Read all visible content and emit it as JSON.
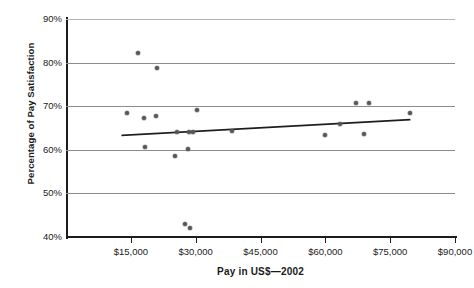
{
  "chart_data": {
    "type": "scatter",
    "title": "",
    "xlabel": "Pay in US$—2002",
    "ylabel": "Percentage of Pay Satisfaction",
    "xlim": [
      0,
      90000
    ],
    "ylim": [
      40,
      90
    ],
    "grid": true,
    "legend_position": "none",
    "xticks": [
      15000,
      30000,
      45000,
      60000,
      75000,
      90000
    ],
    "xtick_labels": [
      "$15,000",
      "$30,000",
      "$45,000",
      "$60,000",
      "$75,000",
      "$90,000"
    ],
    "yticks": [
      40,
      50,
      60,
      70,
      80,
      90
    ],
    "ytick_labels": [
      "40%",
      "50%",
      "60%",
      "70%",
      "80%",
      "90%"
    ],
    "marker_color": "#55555c",
    "trendline_color": "#1d1d1d",
    "points": [
      {
        "x": 14000,
        "y": 68.5
      },
      {
        "x": 16700,
        "y": 82.3
      },
      {
        "x": 18000,
        "y": 67.2
      },
      {
        "x": 18200,
        "y": 60.6
      },
      {
        "x": 20800,
        "y": 67.8
      },
      {
        "x": 21000,
        "y": 78.8
      },
      {
        "x": 25200,
        "y": 58.5
      },
      {
        "x": 25600,
        "y": 64.0
      },
      {
        "x": 27600,
        "y": 42.9
      },
      {
        "x": 28200,
        "y": 60.1
      },
      {
        "x": 28400,
        "y": 64.0
      },
      {
        "x": 28700,
        "y": 42.0
      },
      {
        "x": 29400,
        "y": 64.1
      },
      {
        "x": 30400,
        "y": 69.1
      },
      {
        "x": 38300,
        "y": 64.2
      },
      {
        "x": 60000,
        "y": 63.5
      },
      {
        "x": 63500,
        "y": 66.0
      },
      {
        "x": 67000,
        "y": 70.8
      },
      {
        "x": 69000,
        "y": 63.7
      },
      {
        "x": 70000,
        "y": 70.8
      },
      {
        "x": 79500,
        "y": 68.4
      }
    ],
    "trendline": {
      "x_start": 13000,
      "y_start": 63.3,
      "x_end": 79500,
      "y_end": 66.9,
      "description": "weak positive linear fit"
    }
  }
}
